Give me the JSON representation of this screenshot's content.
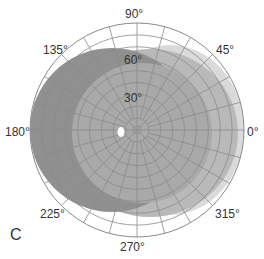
{
  "figure": {
    "panel_label": "C",
    "center": [
      137,
      130
    ],
    "outer_radius": 107,
    "ring_values": [
      10,
      20,
      30,
      40,
      50,
      60,
      70,
      80,
      90
    ],
    "ring_labels": [
      {
        "text": "30°",
        "x": 124,
        "y": 92
      },
      {
        "text": "60°",
        "x": 124,
        "y": 54
      }
    ],
    "angle_labels": [
      {
        "text": "90°",
        "x": 125,
        "y": 8
      },
      {
        "text": "45°",
        "x": 216,
        "y": 44
      },
      {
        "text": "0°",
        "x": 247,
        "y": 126
      },
      {
        "text": "315°",
        "x": 215,
        "y": 208
      },
      {
        "text": "270°",
        "x": 120,
        "y": 241
      },
      {
        "text": "225°",
        "x": 40,
        "y": 208
      },
      {
        "text": "180°",
        "x": 5,
        "y": 126
      },
      {
        "text": "135°",
        "x": 43,
        "y": 44
      }
    ],
    "colors": {
      "grid": "#8a8a8a",
      "field_light": "#d9d9d9",
      "field_mid": "#b5b5b5",
      "field_dark": "#8f8f8f",
      "blind_spot": "#ffffff"
    },
    "fields": [
      {
        "name": "light-visual-field",
        "cx": 170,
        "cy": 130,
        "rx": 74,
        "ry": 85,
        "color": "#dadada"
      },
      {
        "name": "mid-visual-field",
        "cx": 150,
        "cy": 133,
        "rx": 88,
        "ry": 84,
        "color": "#b9b9b9"
      },
      {
        "name": "dark-visual-field",
        "cx": 112,
        "cy": 130,
        "rx": 82,
        "ry": 82,
        "color": "#909090"
      },
      {
        "name": "inner-mid-visual-field",
        "cx": 142,
        "cy": 133,
        "rx": 70,
        "ry": 70,
        "color": "#a9a9a9"
      }
    ],
    "blind_spot": {
      "cx": 121,
      "cy": 132,
      "rx": 3.5,
      "ry": 5
    }
  }
}
